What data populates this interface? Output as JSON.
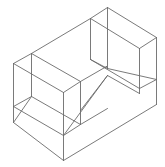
{
  "diagram": {
    "type": "isometric-wireframe",
    "stroke_color": "#6b6b6b",
    "background": "#ffffff",
    "edges": [
      [
        31,
        53,
        90,
        18
      ],
      [
        90,
        18,
        107,
        7
      ],
      [
        107,
        7,
        156,
        37
      ],
      [
        156,
        37,
        139,
        48
      ],
      [
        139,
        48,
        90,
        18
      ],
      [
        13,
        63,
        31,
        53
      ],
      [
        13,
        63,
        63,
        92
      ],
      [
        31,
        53,
        80,
        81
      ],
      [
        63,
        92,
        80,
        81
      ],
      [
        80,
        81,
        106,
        66
      ],
      [
        90,
        18,
        90,
        59
      ],
      [
        107,
        7,
        107,
        68
      ],
      [
        156,
        37,
        156,
        79
      ],
      [
        139,
        48,
        139,
        88
      ],
      [
        90,
        59,
        107,
        68
      ],
      [
        90,
        59,
        139,
        88
      ],
      [
        107,
        68,
        156,
        79
      ],
      [
        106,
        66,
        107,
        68
      ],
      [
        13,
        63,
        13,
        122
      ],
      [
        31,
        53,
        31,
        96
      ],
      [
        63,
        92,
        63,
        160
      ],
      [
        80,
        81,
        80,
        124
      ],
      [
        13,
        106,
        31,
        96
      ],
      [
        13,
        106,
        63,
        135
      ],
      [
        31,
        96,
        80,
        124
      ],
      [
        63,
        135,
        80,
        124
      ],
      [
        80,
        124,
        107,
        108
      ],
      [
        80,
        110,
        107,
        75
      ],
      [
        107,
        75,
        139,
        93
      ],
      [
        63,
        135,
        107,
        75
      ],
      [
        13,
        122,
        63,
        160
      ],
      [
        63,
        160,
        156,
        104
      ],
      [
        156,
        79,
        156,
        104
      ],
      [
        139,
        88,
        156,
        79
      ],
      [
        139,
        88,
        139,
        93
      ],
      [
        13,
        122,
        31,
        96
      ]
    ]
  }
}
